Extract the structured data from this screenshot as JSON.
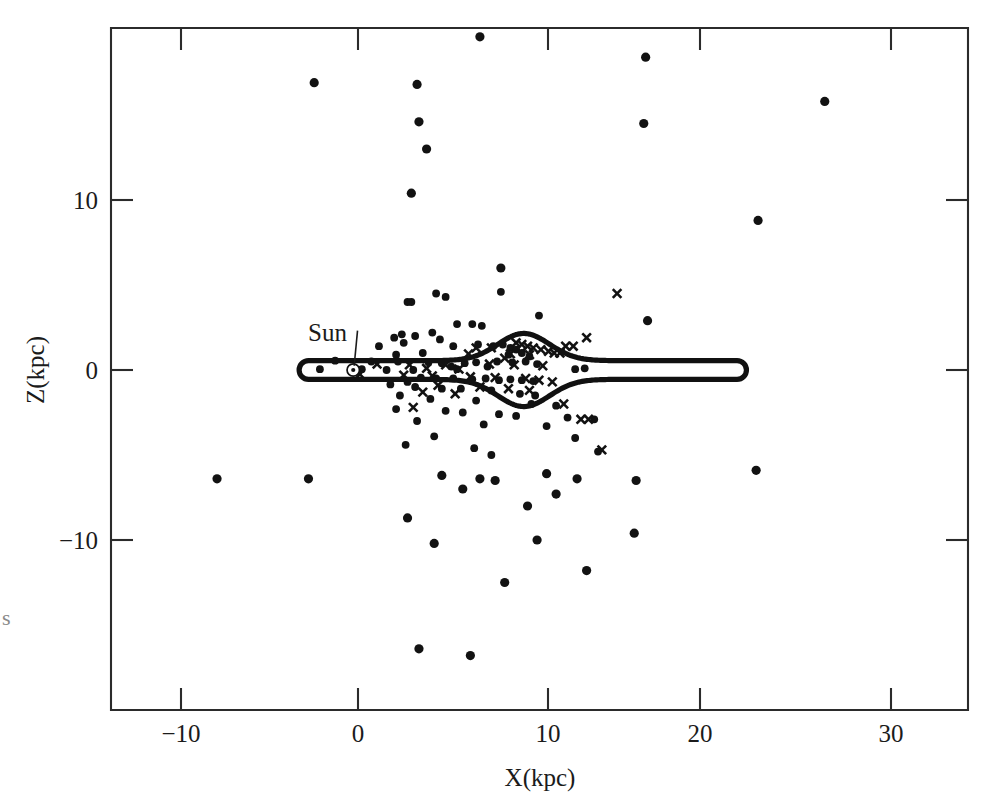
{
  "figure": {
    "kind": "scatter-plot",
    "background": "#ffffff",
    "ink_color": "#121212",
    "edge_artifact": "s"
  },
  "axes": {
    "x": {
      "label": "X(kpc)",
      "tick_values": [
        -10,
        0,
        10,
        20,
        30
      ],
      "tick_labels": [
        "−10",
        "0",
        "10",
        "20",
        "30"
      ],
      "range": [
        -13.0,
        32.0
      ]
    },
    "y": {
      "label": "Z(kpc)",
      "tick_values": [
        -10,
        0,
        10
      ],
      "tick_labels": [
        "−10",
        "0",
        "10"
      ],
      "range": [
        -20.0,
        20.1
      ]
    }
  },
  "annotations": [
    {
      "name": "sun-label",
      "text": "Sun",
      "x_kpc": -1.6,
      "z_kpc": 2.2,
      "leader_from": [
        -0.55,
        1.85
      ],
      "leader_to": [
        -0.2,
        0.25
      ]
    }
  ],
  "sun_marker": {
    "x_kpc": -0.25,
    "z_kpc": 0.0,
    "symbol": "⊙"
  },
  "chart_data": {
    "type": "scatter",
    "title": "",
    "xlabel": "X(kpc)",
    "ylabel": "Z(kpc)",
    "xlim": [
      -13.0,
      32.0
    ],
    "ylim": [
      -20.0,
      20.1
    ],
    "grid": false,
    "legend": null,
    "series": [
      {
        "name": "filled-circles",
        "marker": "circle",
        "color": "#121212",
        "points": [
          [
            6.4,
            19.6
          ],
          [
            15.1,
            18.4
          ],
          [
            -2.3,
            16.9
          ],
          [
            3.1,
            16.8
          ],
          [
            24.5,
            15.8
          ],
          [
            3.2,
            14.6
          ],
          [
            15.0,
            14.5
          ],
          [
            3.6,
            13.0
          ],
          [
            2.8,
            10.4
          ],
          [
            21.0,
            8.8
          ],
          [
            7.5,
            6.0
          ],
          [
            7.5,
            4.6
          ],
          [
            4.1,
            4.5
          ],
          [
            4.6,
            4.3
          ],
          [
            2.6,
            4.0
          ],
          [
            2.8,
            4.0
          ],
          [
            9.5,
            3.2
          ],
          [
            15.2,
            2.9
          ],
          [
            5.2,
            2.7
          ],
          [
            6.0,
            2.7
          ],
          [
            6.5,
            2.6
          ],
          [
            3.9,
            2.2
          ],
          [
            2.3,
            2.1
          ],
          [
            3.0,
            2.0
          ],
          [
            1.9,
            1.9
          ],
          [
            4.3,
            1.8
          ],
          [
            2.4,
            1.6
          ],
          [
            1.1,
            1.4
          ],
          [
            5.0,
            1.4
          ],
          [
            6.3,
            1.5
          ],
          [
            7.1,
            1.4
          ],
          [
            7.6,
            1.5
          ],
          [
            8.0,
            1.3
          ],
          [
            8.3,
            1.2
          ],
          [
            3.4,
            1.0
          ],
          [
            2.0,
            0.9
          ],
          [
            7.9,
            0.9
          ],
          [
            8.6,
            1.0
          ],
          [
            9.0,
            0.8
          ],
          [
            -1.2,
            0.55
          ],
          [
            0.7,
            0.5
          ],
          [
            2.1,
            0.5
          ],
          [
            3.7,
            0.45
          ],
          [
            4.4,
            0.4
          ],
          [
            5.6,
            0.4
          ],
          [
            6.2,
            0.45
          ],
          [
            7.3,
            0.5
          ],
          [
            8.1,
            0.45
          ],
          [
            8.8,
            0.5
          ],
          [
            9.4,
            0.35
          ],
          [
            4.9,
            0.2
          ],
          [
            6.8,
            0.2
          ],
          [
            -2.0,
            0.05
          ],
          [
            0.2,
            0.05
          ],
          [
            1.5,
            0.0
          ],
          [
            2.9,
            0.0
          ],
          [
            5.2,
            0.05
          ],
          [
            11.4,
            0.05
          ],
          [
            11.9,
            0.1
          ],
          [
            3.3,
            -0.45
          ],
          [
            4.1,
            -0.5
          ],
          [
            5.0,
            -0.5
          ],
          [
            6.0,
            -0.55
          ],
          [
            6.7,
            -0.5
          ],
          [
            7.4,
            -0.6
          ],
          [
            8.0,
            -0.55
          ],
          [
            8.6,
            -0.6
          ],
          [
            9.2,
            -0.65
          ],
          [
            2.6,
            -0.7
          ],
          [
            1.7,
            -0.85
          ],
          [
            3.0,
            -1.0
          ],
          [
            4.4,
            -1.1
          ],
          [
            5.4,
            -1.1
          ],
          [
            7.0,
            -1.2
          ],
          [
            8.5,
            -1.4
          ],
          [
            9.3,
            -1.5
          ],
          [
            2.2,
            -1.5
          ],
          [
            3.8,
            -1.7
          ],
          [
            6.2,
            -1.8
          ],
          [
            9.1,
            -2.0
          ],
          [
            10.4,
            -2.1
          ],
          [
            2.0,
            -2.3
          ],
          [
            4.6,
            -2.4
          ],
          [
            5.5,
            -2.5
          ],
          [
            7.4,
            -2.6
          ],
          [
            8.3,
            -2.7
          ],
          [
            11.0,
            -2.8
          ],
          [
            12.4,
            -2.9
          ],
          [
            3.1,
            -3.0
          ],
          [
            6.6,
            -3.2
          ],
          [
            9.9,
            -3.3
          ],
          [
            4.0,
            -3.9
          ],
          [
            11.4,
            -4.0
          ],
          [
            2.5,
            -4.4
          ],
          [
            6.1,
            -4.6
          ],
          [
            7.0,
            -5.0
          ],
          [
            12.6,
            -4.8
          ],
          [
            -7.4,
            -6.4
          ],
          [
            -2.6,
            -6.4
          ],
          [
            9.9,
            -6.1
          ],
          [
            20.9,
            -5.9
          ],
          [
            4.4,
            -6.2
          ],
          [
            6.4,
            -6.4
          ],
          [
            7.2,
            -6.5
          ],
          [
            11.5,
            -6.4
          ],
          [
            5.5,
            -7.0
          ],
          [
            10.4,
            -7.3
          ],
          [
            14.6,
            -6.5
          ],
          [
            2.6,
            -8.7
          ],
          [
            8.9,
            -8.0
          ],
          [
            14.5,
            -9.6
          ],
          [
            4.0,
            -10.2
          ],
          [
            9.4,
            -10.0
          ],
          [
            12.0,
            -11.8
          ],
          [
            7.7,
            -12.5
          ],
          [
            3.2,
            -16.4
          ],
          [
            5.9,
            -16.8
          ]
        ]
      },
      {
        "name": "crosses",
        "marker": "x",
        "color": "#121212",
        "points": [
          [
            13.6,
            4.5
          ],
          [
            12.0,
            1.9
          ],
          [
            6.2,
            1.3
          ],
          [
            7.0,
            1.3
          ],
          [
            8.3,
            1.6
          ],
          [
            8.6,
            1.5
          ],
          [
            8.9,
            1.4
          ],
          [
            9.2,
            1.3
          ],
          [
            9.6,
            1.2
          ],
          [
            10.0,
            1.1
          ],
          [
            10.3,
            1.0
          ],
          [
            10.6,
            1.0
          ],
          [
            10.9,
            1.4
          ],
          [
            11.3,
            1.4
          ],
          [
            5.8,
            0.95
          ],
          [
            8.0,
            0.95
          ],
          [
            9.0,
            0.9
          ],
          [
            7.7,
            0.7
          ],
          [
            1.0,
            0.35
          ],
          [
            2.7,
            0.3
          ],
          [
            4.6,
            0.3
          ],
          [
            6.9,
            0.35
          ],
          [
            8.2,
            0.3
          ],
          [
            9.7,
            0.25
          ],
          [
            3.6,
            0.1
          ],
          [
            5.3,
            0.05
          ],
          [
            0.1,
            -0.25
          ],
          [
            2.4,
            -0.3
          ],
          [
            3.9,
            -0.35
          ],
          [
            5.9,
            -0.4
          ],
          [
            7.2,
            -0.45
          ],
          [
            8.8,
            -0.5
          ],
          [
            9.5,
            -0.6
          ],
          [
            10.2,
            -0.7
          ],
          [
            4.2,
            -0.9
          ],
          [
            6.4,
            -1.0
          ],
          [
            7.9,
            -1.1
          ],
          [
            9.0,
            -1.2
          ],
          [
            3.4,
            -1.3
          ],
          [
            5.1,
            -1.4
          ],
          [
            10.8,
            -2.0
          ],
          [
            2.9,
            -2.2
          ],
          [
            11.7,
            -2.9
          ],
          [
            12.1,
            -2.9
          ],
          [
            12.8,
            -4.7
          ]
        ]
      }
    ]
  },
  "disk_outline": {
    "name": "galactic-disk-outline",
    "description": "closed contour of the Milky Way disk seen edge-on with central bulge near x=8.7 kpc, thin disk extending to x=20 kpc and blunt left cap near x=-2.6 kpc",
    "half_thickness_thin": 0.55,
    "bulge_center_x": 8.7,
    "bulge_half_height": 2.15,
    "left_end_x": -2.6,
    "right_end_x": 19.9
  }
}
